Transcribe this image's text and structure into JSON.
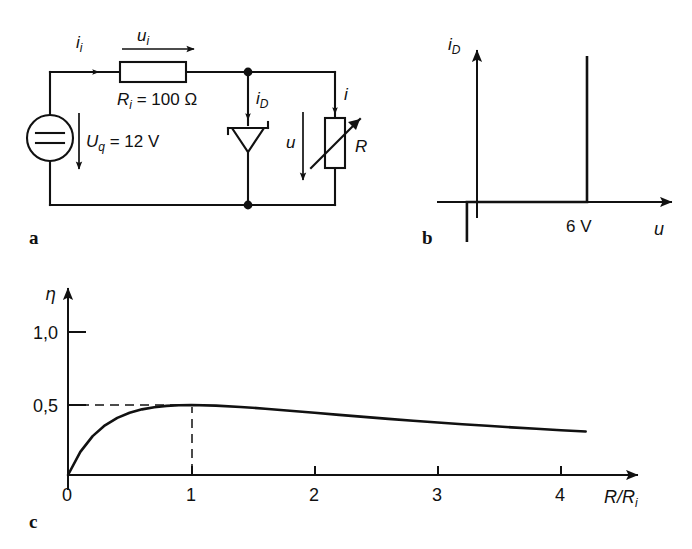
{
  "figure": {
    "panels": [
      {
        "key": "a",
        "label": "a",
        "caption": "circuit schematic"
      },
      {
        "key": "b",
        "label": "b",
        "caption": "zener diode characteristic"
      },
      {
        "key": "c",
        "label": "c",
        "caption": "efficiency curve"
      }
    ]
  },
  "circuit": {
    "source_label_main": "U",
    "source_label_sub": "q",
    "source_value": " = 12 V",
    "source_symbol": "dc-voltage-source",
    "resistor_label_main": "R",
    "resistor_label_sub": "i",
    "resistor_value": " = 100 Ω",
    "input_current_main": "i",
    "input_current_sub": "i",
    "input_voltage_main": "u",
    "input_voltage_sub": "i",
    "diode_current_main": "i",
    "diode_current_sub": "D",
    "diode_symbol": "zener-diode",
    "load_voltage": "u",
    "load_current": "i",
    "load_resistor": "R",
    "load_symbol": "variable-resistor"
  },
  "chart_data": [
    {
      "id": "panel-b",
      "type": "line",
      "title": "",
      "xlabel": "u",
      "ylabel": "i_D",
      "ylabel_main": "i",
      "ylabel_sub": "D",
      "annotation": "6 V",
      "breakdown_voltage": 6,
      "breakdown_unit": "V",
      "description": "Idealised Zener diode characteristic: zero current for reverse voltage above breakdown and for forward voltage below 6 V, then vertical rise at u = 6 V; vertical reverse-breakdown branch just left of the origin.",
      "xlim": [
        -1.2,
        9.5
      ],
      "ylim": [
        -2.2,
        8.0
      ],
      "grid": false,
      "legend": null,
      "segments": [
        {
          "name": "reverse-branch",
          "x": [
            -0.55,
            -0.55
          ],
          "y": [
            -2.0,
            0.0
          ]
        },
        {
          "name": "zero-current-branch",
          "x": [
            -0.55,
            6.0
          ],
          "y": [
            0.0,
            0.0
          ]
        },
        {
          "name": "forward-rise",
          "x": [
            6.0,
            6.0
          ],
          "y": [
            0.0,
            7.3
          ]
        }
      ],
      "xticks": [
        {
          "value": 6,
          "label": "6 V"
        }
      ],
      "yticks": []
    },
    {
      "id": "panel-c",
      "type": "line",
      "title": "",
      "xlabel": "R/R_i",
      "xlabel_main": "R/R",
      "xlabel_sub": "i",
      "ylabel": "η",
      "description": "Efficiency eta = (R/Ri) / (1 + R/Ri)^2 versus normalised load resistance; maximum value 0,5 at R/Ri = 1.",
      "xlim": [
        0,
        4.8
      ],
      "ylim": [
        0,
        1.15
      ],
      "grid": false,
      "legend": null,
      "xticks": [
        {
          "value": 0,
          "label": "0"
        },
        {
          "value": 1,
          "label": "1"
        },
        {
          "value": 2,
          "label": "2"
        },
        {
          "value": 3,
          "label": "3"
        },
        {
          "value": 4,
          "label": "4"
        }
      ],
      "yticks": [
        {
          "value": 0.5,
          "label": "0,5"
        },
        {
          "value": 1.0,
          "label": "1,0"
        }
      ],
      "guides": [
        {
          "name": "eta-max-horizontal",
          "from": [
            0,
            0.5
          ],
          "to": [
            1,
            0.5
          ],
          "style": "dashed"
        },
        {
          "name": "eta-max-vertical",
          "from": [
            1,
            0
          ],
          "to": [
            1,
            0.5
          ],
          "style": "dashed"
        }
      ],
      "peak": {
        "x": 1,
        "y": 0.5
      },
      "x": [
        0,
        0.1,
        0.2,
        0.3,
        0.4,
        0.5,
        0.6,
        0.7,
        0.8,
        0.9,
        1.0,
        1.2,
        1.4,
        1.6,
        1.8,
        2.0,
        2.2,
        2.4,
        2.6,
        2.8,
        3.0,
        3.2,
        3.4,
        3.6,
        3.8,
        4.0,
        4.2
      ],
      "values": [
        0.0,
        0.0826,
        0.1389,
        0.1775,
        0.2041,
        0.2222,
        0.2344,
        0.2422,
        0.2469,
        0.2493,
        0.25,
        0.2479,
        0.2431,
        0.2367,
        0.2296,
        0.2222,
        0.2148,
        0.2076,
        0.2006,
        0.1939,
        0.1875,
        0.1814,
        0.1757,
        0.1702,
        0.1651,
        0.16,
        0.1555
      ],
      "values_note": "plotted values are eta normalised so that peak renders at the 0,5 gridline"
    }
  ]
}
